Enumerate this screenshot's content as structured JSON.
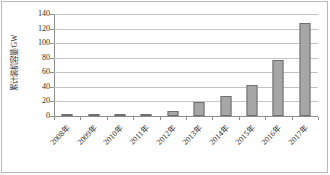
{
  "chart_data": {
    "type": "bar",
    "title": "",
    "subtitle": "",
    "xlabel": "",
    "ylabel": "累计装机容量/GW",
    "categories": [
      "2008年",
      "2009年",
      "2010年",
      "2011年",
      "2012年",
      "2013年",
      "2014年",
      "2015年",
      "2016年",
      "2017年"
    ],
    "values": [
      0.15,
      0.3,
      0.8,
      3,
      6.5,
      19,
      27,
      42,
      77,
      128
    ],
    "ylim": [
      0,
      140
    ],
    "yticks": [
      0,
      20,
      40,
      60,
      80,
      100,
      120,
      140
    ],
    "ytick_labels": [
      "0",
      "20",
      "40",
      "60",
      "80",
      "100",
      "120",
      "140"
    ],
    "grid": true,
    "legend": false,
    "legend_position": "none",
    "series": [
      {
        "name": "累计装机容量",
        "values": [
          0.15,
          0.3,
          0.8,
          3,
          6.5,
          19,
          27,
          42,
          77,
          128
        ]
      }
    ]
  },
  "style": {
    "bar_fill": "#a6a6a6",
    "bar_border": "#6e6e6e",
    "gridline_color": "#c4c4c4",
    "axis_color": "#8d8d8d",
    "frame_color": "#b9b9b9",
    "text_color": "#2b2b2b",
    "background": "#ffffff"
  }
}
